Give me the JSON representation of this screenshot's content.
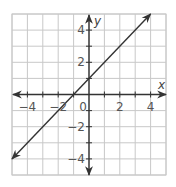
{
  "chart_data": {
    "type": "line",
    "title": "",
    "xlabel": "x",
    "ylabel": "y",
    "xlim": [
      -5,
      5
    ],
    "ylim": [
      -5,
      5
    ],
    "grid": true,
    "grid_step": 1,
    "x_tick_labels": [
      {
        "value": -4,
        "text": "−4"
      },
      {
        "value": -2,
        "text": "−2"
      },
      {
        "value": 0,
        "text": "0"
      },
      {
        "value": 2,
        "text": "2"
      },
      {
        "value": 4,
        "text": "4"
      }
    ],
    "y_tick_labels": [
      {
        "value": 4,
        "text": "4"
      },
      {
        "value": 2,
        "text": "2"
      },
      {
        "value": -2,
        "text": "−2"
      },
      {
        "value": -4,
        "text": "−4"
      }
    ],
    "series": [
      {
        "name": "y = x + 1",
        "equation": "y = x + 1",
        "x": [
          -5,
          4
        ],
        "y": [
          -4,
          5
        ],
        "arrows_both_ends": true
      }
    ],
    "colors": {
      "line": "#333333",
      "grid": "#c8c8c8",
      "axis": "#333333"
    }
  }
}
